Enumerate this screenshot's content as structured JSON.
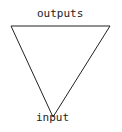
{
  "diagram": {
    "type": "inverted-triangle",
    "labels": {
      "top": "outputs",
      "bottom": "input"
    },
    "vertices": [
      [
        11,
        26
      ],
      [
        110,
        26
      ],
      [
        53,
        118
      ]
    ],
    "stroke_color": "#222222"
  }
}
